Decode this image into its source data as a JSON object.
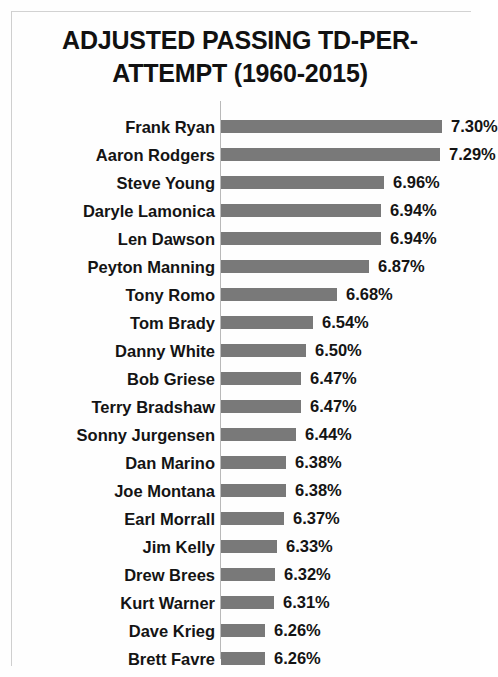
{
  "chart_data": {
    "type": "bar",
    "orientation": "horizontal",
    "title_lines": [
      "ADJUSTED PASSING TD-PER-",
      "ATTEMPT (1960-2015)"
    ],
    "xlabel": "",
    "ylabel": "",
    "grid": false,
    "legend": null,
    "value_suffix": "%",
    "xlim": [
      6.0,
      7.47
    ],
    "bar_color": "#797979",
    "categories": [
      "Frank Ryan",
      "Aaron Rodgers",
      "Steve Young",
      "Daryle Lamonica",
      "Len Dawson",
      "Peyton Manning",
      "Tony Romo",
      "Tom Brady",
      "Danny White",
      "Bob Griese",
      "Terry Bradshaw",
      "Sonny Jurgensen",
      "Dan Marino",
      "Joe Montana",
      "Earl Morrall",
      "Jim Kelly",
      "Drew Brees",
      "Kurt Warner",
      "Dave Krieg",
      "Brett Favre"
    ],
    "values": [
      7.3,
      7.29,
      6.96,
      6.94,
      6.94,
      6.87,
      6.68,
      6.54,
      6.5,
      6.47,
      6.47,
      6.44,
      6.38,
      6.38,
      6.37,
      6.33,
      6.32,
      6.31,
      6.26,
      6.26
    ],
    "value_labels": [
      "7.30%",
      "7.29%",
      "6.96%",
      "6.94%",
      "6.94%",
      "6.87%",
      "6.68%",
      "6.54%",
      "6.50%",
      "6.47%",
      "6.47%",
      "6.44%",
      "6.38%",
      "6.38%",
      "6.37%",
      "6.33%",
      "6.32%",
      "6.31%",
      "6.26%",
      "6.26%"
    ]
  }
}
